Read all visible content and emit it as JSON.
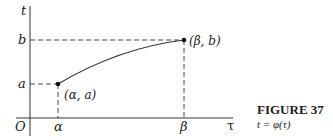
{
  "figure": {
    "caption_title": "FIGURE 37",
    "caption_subtitle": "t = φ(τ)"
  },
  "axes": {
    "vertical_label": "t",
    "horizontal_label": "τ",
    "origin_label": "O"
  },
  "ticks": {
    "x": [
      {
        "label": "α"
      },
      {
        "label": "β"
      }
    ],
    "y": [
      {
        "label": "a"
      },
      {
        "label": "b"
      }
    ]
  },
  "points": [
    {
      "label": "(α, a)"
    },
    {
      "label": "(β, b)"
    }
  ],
  "colors": {
    "ink": "#222222",
    "background": "#ffffff"
  }
}
